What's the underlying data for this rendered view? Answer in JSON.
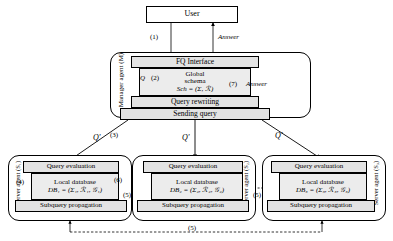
{
  "diagram": {
    "user": {
      "label": "User"
    },
    "manager": {
      "label": "Manager agent (M)",
      "fq_interface": "FQ Interface",
      "global_schema_line1": "Global",
      "global_schema_line2": "schema",
      "global_schema_line3": "Sch = (Σ, ℛ)",
      "query_rewriting": "Query rewriting",
      "sending_query": "Sending query"
    },
    "agents": [
      {
        "label": "Server agent (S₁)",
        "label_side": "left",
        "query_evaluation": "Query evaluation",
        "local_database": "Local database",
        "db": "DB₁ = (Σ₁, ℛ₁, 𝒢₁)",
        "subquery_propagation": "Subquery propagation"
      },
      {
        "label": "Server agent (S₂)",
        "label_side": "right",
        "query_evaluation": "Query evaluation",
        "local_database": "Local database",
        "db": "DB₂ = (Σ₂, ℛ₂, 𝒢₂)",
        "subquery_propagation": "Subquery propagation"
      },
      {
        "label": "Server agent (S₃)",
        "label_side": "right",
        "query_evaluation": "Query evaluation",
        "local_database": "Local database",
        "db": "DB₃ = (Σ₃, ℛ₃, 𝒢₃)",
        "subquery_propagation": "Subquery propagation"
      }
    ],
    "edge_labels": {
      "step1": "(1)",
      "answer_top": "Answer",
      "q_left": "Q",
      "step2": "(2)",
      "step7": "(7)",
      "answer_mid": "Answer",
      "step3": "(3)",
      "q_prime_left": "Q'",
      "q_prime_mid": "Q'",
      "q_prime_right": "Q'",
      "step4": "(4)",
      "step6": "(6)",
      "step5_a": "(5)",
      "step5_b": "(5)",
      "step5_bottom": "(5)"
    }
  }
}
